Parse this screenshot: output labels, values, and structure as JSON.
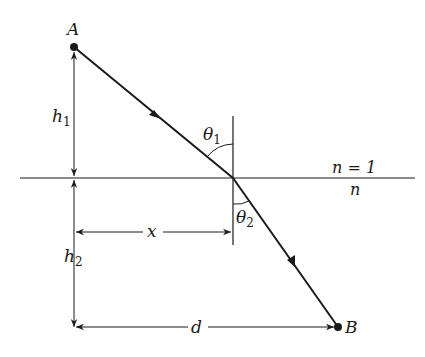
{
  "diagram": {
    "points": {
      "A": {
        "label": "A"
      },
      "B": {
        "label": "B"
      }
    },
    "media": {
      "upper": {
        "label": "n = 1"
      },
      "lower": {
        "label": "n"
      }
    },
    "angles": {
      "theta1": {
        "symbol": "θ",
        "sub": "1"
      },
      "theta2": {
        "symbol": "θ",
        "sub": "2"
      }
    },
    "dimensions": {
      "h1": {
        "symbol": "h",
        "sub": "1"
      },
      "h2": {
        "symbol": "h",
        "sub": "2"
      },
      "x": {
        "label": "x"
      },
      "d": {
        "label": "d"
      }
    },
    "colors": {
      "line": "#1a1a1a",
      "background": "#ffffff"
    }
  }
}
